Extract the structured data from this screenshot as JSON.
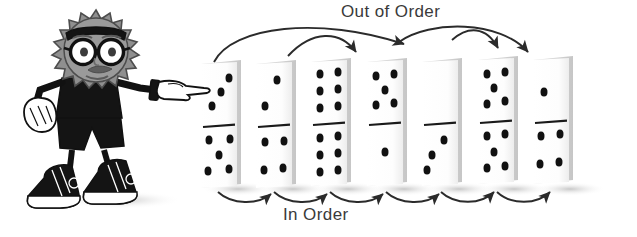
{
  "illustration": {
    "title_top": "Out of Order",
    "title_bottom": "In Order",
    "palette": {
      "ink": "#1a1a1a",
      "text": "#3a3a3a",
      "domino_face": "#fdfdfd",
      "domino_side": "#d8d8d8",
      "shadow": "#c9c9c9",
      "character_head": "#8f8f8f",
      "character_head_outline": "#4d4d4d",
      "glove": "#ffffff",
      "page_bg": "#ffffff"
    },
    "character": {
      "name": "spiky-haired-pointing-mascot",
      "accessories": [
        "glasses",
        "headband",
        "mustache",
        "gloves",
        "high-top-sneakers",
        "shorts"
      ],
      "pointing_direction": "right"
    },
    "arrows": {
      "top_label": "Out of Order",
      "top_description": "long crossing arcs that skip over dominoes",
      "top_count": 4,
      "bottom_label": "In Order",
      "bottom_description": "short arcs linking each adjacent domino",
      "bottom_count": 6
    },
    "dominoes": [
      {
        "index": 1,
        "top": 3,
        "bottom": 5,
        "occluded": true
      },
      {
        "index": 2,
        "top": 2,
        "bottom": 4,
        "occluded": false
      },
      {
        "index": 3,
        "top": 6,
        "bottom": 6,
        "occluded": false
      },
      {
        "index": 4,
        "top": 5,
        "bottom": 1,
        "occluded": false
      },
      {
        "index": 5,
        "top": 0,
        "bottom": 3,
        "occluded": false
      },
      {
        "index": 6,
        "top": 6,
        "bottom": 6,
        "occluded": false
      },
      {
        "index": 7,
        "top": 1,
        "bottom": 4,
        "occluded": false
      }
    ]
  }
}
